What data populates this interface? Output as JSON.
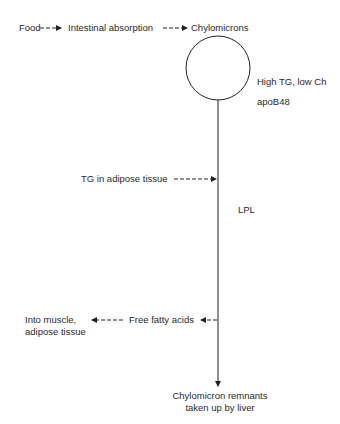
{
  "diagram": {
    "type": "flow",
    "top_flow": {
      "food": "Food",
      "absorption": "Intestinal absorption",
      "chylomicrons": "Chylomicrons"
    },
    "particle_properties": {
      "composition": "High TG, low Ch",
      "apoprotein": "apoB48"
    },
    "tg_adipose": "TG in adipose tissue",
    "enzyme": "LPL",
    "free_fatty_acids": "Free fatty acids",
    "destination_line1": "Into muscle,",
    "destination_line2": "adipose tissue",
    "endpoint_line1": "Chylomicron remnants",
    "endpoint_line2": "taken up by liver"
  },
  "colors": {
    "stroke": "#222222",
    "text": "#2a2a2a"
  }
}
